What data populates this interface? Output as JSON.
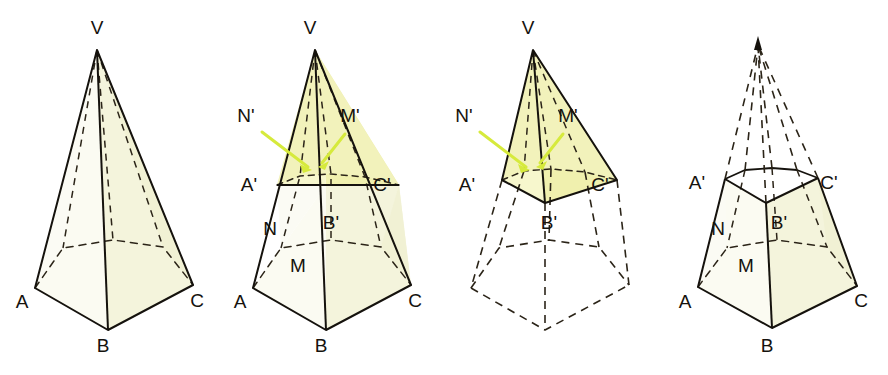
{
  "figure_caption": "",
  "colors": {
    "stroke": "#15120d",
    "fill_pale": "#f6f6e2",
    "fill_bright": "#f2f2b4",
    "arrow": "#d6ea3c",
    "background": "#ffffff"
  },
  "figures": [
    {
      "id": "figure-1-full-pyramid",
      "title": "Pentagonal pyramid with apex V and base ABC",
      "labels": [
        {
          "name": "apex-v",
          "text": "V",
          "x": 97,
          "y": 34
        },
        {
          "name": "vertex-a",
          "text": "A",
          "x": 22,
          "y": 308
        },
        {
          "name": "vertex-b",
          "text": "B",
          "x": 103,
          "y": 352
        },
        {
          "name": "vertex-c",
          "text": "C",
          "x": 197,
          "y": 307
        }
      ]
    },
    {
      "id": "figure-2-pyramid-with-cut",
      "title": "Pyramid cut by a plane A'B'C' parallel to the base",
      "labels": [
        {
          "name": "apex-v",
          "text": "V",
          "x": 310,
          "y": 34
        },
        {
          "name": "point-n-prime",
          "text": "N'",
          "x": 246,
          "y": 122
        },
        {
          "name": "point-m-prime",
          "text": "M'",
          "x": 350,
          "y": 122
        },
        {
          "name": "point-a-prime",
          "text": "A'",
          "x": 249,
          "y": 191
        },
        {
          "name": "point-c-prime",
          "text": "C'",
          "x": 382,
          "y": 191
        },
        {
          "name": "point-b-prime",
          "text": "B'",
          "x": 331,
          "y": 229
        },
        {
          "name": "point-n",
          "text": "N",
          "x": 270,
          "y": 235
        },
        {
          "name": "point-m",
          "text": "M",
          "x": 298,
          "y": 272
        },
        {
          "name": "vertex-a",
          "text": "A",
          "x": 240,
          "y": 308
        },
        {
          "name": "vertex-b",
          "text": "B",
          "x": 321,
          "y": 352
        },
        {
          "name": "vertex-c",
          "text": "C",
          "x": 415,
          "y": 307
        }
      ]
    },
    {
      "id": "figure-3-upper-pyramid-solid",
      "title": "Upper small pyramid VA'B'C' shown solid, lower frustum dashed",
      "labels": [
        {
          "name": "apex-v",
          "text": "V",
          "x": 528,
          "y": 34
        },
        {
          "name": "point-n-prime",
          "text": "N'",
          "x": 464,
          "y": 122
        },
        {
          "name": "point-m-prime",
          "text": "M'",
          "x": 568,
          "y": 122
        },
        {
          "name": "point-a-prime",
          "text": "A'",
          "x": 467,
          "y": 191
        },
        {
          "name": "point-c-prime",
          "text": "C'",
          "x": 600,
          "y": 191
        },
        {
          "name": "point-b-prime",
          "text": "B'",
          "x": 549,
          "y": 229
        }
      ]
    },
    {
      "id": "figure-4-frustum",
      "title": "Resulting frustum ABCA'B'C' with removed apex shown dashed",
      "labels": [
        {
          "name": "point-a-prime",
          "text": "A'",
          "x": 697,
          "y": 189
        },
        {
          "name": "point-c-prime",
          "text": "C'",
          "x": 829,
          "y": 189
        },
        {
          "name": "point-b-prime",
          "text": "B'",
          "x": 779,
          "y": 229
        },
        {
          "name": "point-n",
          "text": "N",
          "x": 718,
          "y": 235
        },
        {
          "name": "point-m",
          "text": "M",
          "x": 746,
          "y": 272
        },
        {
          "name": "vertex-a",
          "text": "A",
          "x": 685,
          "y": 308
        },
        {
          "name": "vertex-b",
          "text": "B",
          "x": 767,
          "y": 352
        },
        {
          "name": "vertex-c",
          "text": "C",
          "x": 861,
          "y": 307
        }
      ]
    }
  ]
}
